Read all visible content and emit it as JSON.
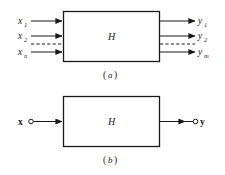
{
  "figure": {
    "background_color": "#ffffff",
    "ink_color": "#1a1a1a",
    "panels": [
      {
        "id": "panel-a",
        "caption": "(a)",
        "caption_open": "(",
        "caption_letter": "a",
        "caption_close": ")",
        "block_label": "H",
        "description": "multiple-input multiple-output system",
        "inputs": [
          {
            "base": "x",
            "sub": "1",
            "text": "x1",
            "style": "solid"
          },
          {
            "base": "x",
            "sub": "2",
            "text": "x2",
            "style": "solid"
          },
          {
            "base": "",
            "sub": "",
            "text": "",
            "style": "dashed"
          },
          {
            "base": "x",
            "sub": "n",
            "text": "xn",
            "style": "solid"
          }
        ],
        "outputs": [
          {
            "base": "y",
            "sub": "1",
            "text": "y1",
            "style": "solid"
          },
          {
            "base": "y",
            "sub": "2",
            "text": "y2",
            "style": "solid"
          },
          {
            "base": "",
            "sub": "",
            "text": "",
            "style": "dashed"
          },
          {
            "base": "y",
            "sub": "m",
            "text": "ym",
            "style": "solid"
          }
        ]
      },
      {
        "id": "panel-b",
        "caption": "(b)",
        "caption_open": "(",
        "caption_letter": "b",
        "caption_close": ")",
        "block_label": "H",
        "description": "vector input vector output system",
        "inputs": [
          {
            "base": "x",
            "sub": "",
            "text": "x",
            "style": "solid-terminal"
          }
        ],
        "outputs": [
          {
            "base": "y",
            "sub": "",
            "text": "y",
            "style": "solid-terminal"
          }
        ]
      }
    ]
  }
}
